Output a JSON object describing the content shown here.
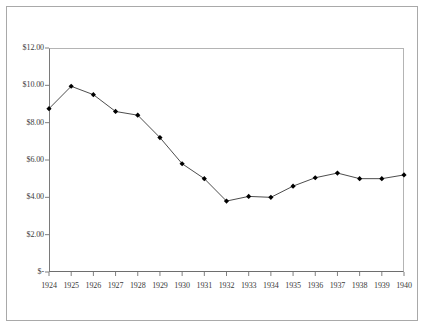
{
  "chart_data": {
    "type": "line",
    "title": "",
    "subtitle": "",
    "xlabel": "",
    "ylabel": "",
    "categories": [
      "1924",
      "1925",
      "1926",
      "1927",
      "1928",
      "1929",
      "1930",
      "1931",
      "1932",
      "1933",
      "1934",
      "1935",
      "1936",
      "1937",
      "1938",
      "1939",
      "1940"
    ],
    "values": [
      8.75,
      9.95,
      9.5,
      8.6,
      8.4,
      7.2,
      5.8,
      5.0,
      3.8,
      4.05,
      4.0,
      4.6,
      5.05,
      5.3,
      5.0,
      5.0,
      5.2
    ],
    "series": [
      {
        "name": "",
        "values": [
          8.75,
          9.95,
          9.5,
          8.6,
          8.4,
          7.2,
          5.8,
          5.0,
          3.8,
          4.05,
          4.0,
          4.6,
          5.05,
          5.3,
          5.0,
          5.0,
          5.2
        ]
      }
    ],
    "ylim": [
      0,
      12
    ],
    "xlim": [
      "1924",
      "1940"
    ],
    "y_ticks": [
      0,
      2,
      4,
      6,
      8,
      10,
      12
    ],
    "y_tick_labels": [
      "$-",
      "$2.00",
      "$4.00",
      "$6.00",
      "$8.00",
      "$10.00",
      "$12.00"
    ],
    "x_tick_labels": [
      "1924",
      "1925",
      "1926",
      "1927",
      "1928",
      "1929",
      "1930",
      "1931",
      "1932",
      "1933",
      "1934",
      "1935",
      "1936",
      "1937",
      "1938",
      "1939",
      "1940"
    ],
    "grid": false,
    "legend": null,
    "legend_position": "none",
    "marker": "diamond",
    "line_color": "#4d4d4d",
    "marker_color": "#000000",
    "axis_color": "#808080",
    "plot_background": "#ffffff",
    "annotations": []
  }
}
